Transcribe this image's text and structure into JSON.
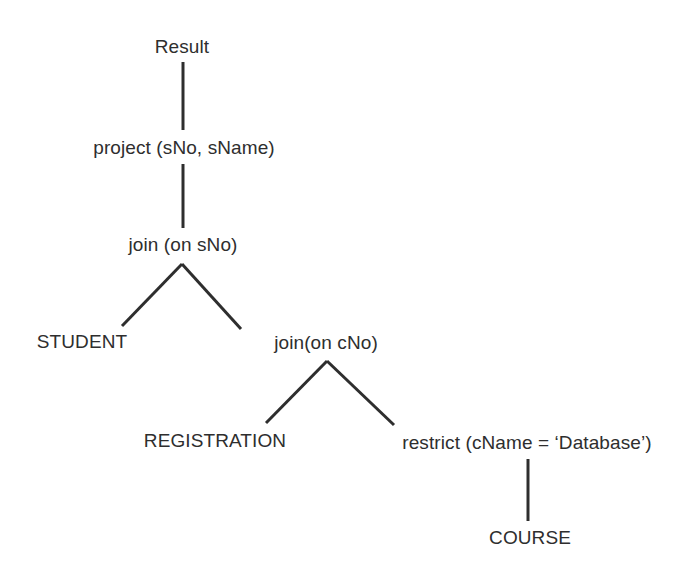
{
  "diagram": {
    "type": "query-tree",
    "title_text": "",
    "background_color": "#ffffff",
    "line_color": "#2e2e2e",
    "text_color": "#2e2e2e",
    "nodes": [
      {
        "id": "result",
        "label": "Result",
        "kind": "result",
        "x": 182,
        "y": 46
      },
      {
        "id": "project",
        "label": "project (sNo, sName)",
        "kind": "operator",
        "x": 184,
        "y": 147
      },
      {
        "id": "join_sno",
        "label": "join (on sNo)",
        "kind": "operator",
        "x": 183,
        "y": 244
      },
      {
        "id": "student",
        "label": "STUDENT",
        "kind": "relation",
        "x": 82,
        "y": 341
      },
      {
        "id": "join_cno",
        "label": "join(on cNo)",
        "kind": "operator",
        "x": 326,
        "y": 342
      },
      {
        "id": "registration",
        "label": "REGISTRATION",
        "kind": "relation",
        "x": 215,
        "y": 440
      },
      {
        "id": "restrict",
        "label": "restrict (cName = ‘Database’)",
        "kind": "operator",
        "x": 527,
        "y": 442
      },
      {
        "id": "course",
        "label": "COURSE",
        "kind": "relation",
        "x": 530,
        "y": 537
      }
    ],
    "edges": [
      {
        "id": "e-result-project",
        "from": "result",
        "to": "project",
        "x1": 183,
        "y1": 62,
        "x2": 183,
        "y2": 130
      },
      {
        "id": "e-project-join_sno",
        "from": "project",
        "to": "join_sno",
        "x1": 183,
        "y1": 164,
        "x2": 183,
        "y2": 228
      },
      {
        "id": "e-join_sno-student",
        "from": "join_sno",
        "to": "student",
        "x1": 182,
        "y1": 264,
        "x2": 122,
        "y2": 326
      },
      {
        "id": "e-join_sno-join_cno",
        "from": "join_sno",
        "to": "join_cno",
        "x1": 182,
        "y1": 264,
        "x2": 241,
        "y2": 329
      },
      {
        "id": "e-join_cno-regist",
        "from": "join_cno",
        "to": "registration",
        "x1": 327,
        "y1": 361,
        "x2": 266,
        "y2": 423
      },
      {
        "id": "e-join_cno-restrict",
        "from": "join_cno",
        "to": "restrict",
        "x1": 327,
        "y1": 361,
        "x2": 394,
        "y2": 425
      },
      {
        "id": "e-restrict-course",
        "from": "restrict",
        "to": "course",
        "x1": 528,
        "y1": 459,
        "x2": 528,
        "y2": 521
      }
    ]
  }
}
